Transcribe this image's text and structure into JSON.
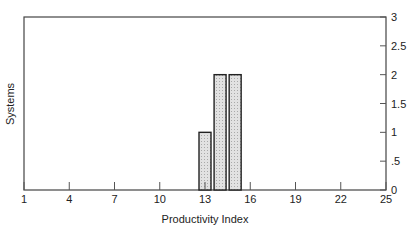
{
  "chart_data": {
    "type": "bar",
    "title": "",
    "xlabel": "Productivity Index",
    "ylabel": "Systems",
    "x": [
      13,
      14,
      15
    ],
    "values": [
      1,
      2,
      2
    ],
    "xlim": [
      1,
      25
    ],
    "ylim": [
      0,
      3
    ],
    "xticks": [
      "1",
      "4",
      "7",
      "10",
      "13",
      "16",
      "19",
      "22",
      "25"
    ],
    "yticks": [
      "0",
      ".5",
      "1",
      "1.5",
      "2",
      "2.5",
      "3"
    ],
    "y_axis_position": "right",
    "grid": false,
    "legend": null
  }
}
